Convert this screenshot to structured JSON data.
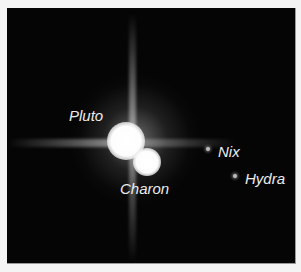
{
  "image": {
    "description": "Telescope image of Pluto system on black background",
    "background_color": "#050505",
    "labels": {
      "pluto": "Pluto",
      "charon": "Charon",
      "nix": "Nix",
      "hydra": "Hydra"
    }
  }
}
